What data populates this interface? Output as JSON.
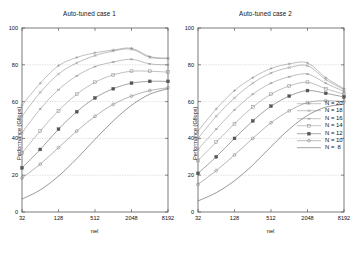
{
  "figure": {
    "width": 359,
    "height": 256,
    "background": "#ffffff"
  },
  "legend": {
    "position": "right-middle",
    "entries": [
      {
        "label": "N = 20",
        "marker": "plus",
        "color": "#8a8a8a"
      },
      {
        "label": "N = 18",
        "marker": "cross",
        "color": "#8a8a8a"
      },
      {
        "label": "N = 16",
        "marker": "asterisk",
        "color": "#8a8a8a"
      },
      {
        "label": "N = 14",
        "marker": "open-square",
        "color": "#8a8a8a"
      },
      {
        "label": "N = 12",
        "marker": "filled-square",
        "color": "#555555"
      },
      {
        "label": "N = 10",
        "marker": "open-circle",
        "color": "#777777"
      },
      {
        "label": "N =  8",
        "marker": "line-only",
        "color": "#444444"
      }
    ]
  },
  "chart_data": [
    {
      "type": "line",
      "title": "Auto-tuned case 1",
      "xlabel": "nel",
      "ylabel": "Performance (Gflops)",
      "xscale": "log2",
      "xticks": [
        32,
        128,
        512,
        2048,
        8192
      ],
      "xticklabels": [
        "32",
        "128",
        "512",
        "2048",
        "8192"
      ],
      "xlim": [
        32,
        8192
      ],
      "yticks": [
        0,
        20,
        40,
        60,
        80,
        100
      ],
      "yticklabels": [
        "0",
        "20",
        "40",
        "60",
        "80",
        "100"
      ],
      "ylim": [
        0,
        100
      ],
      "grid": "y-dashed",
      "x": [
        32,
        64,
        128,
        256,
        512,
        1024,
        2048,
        4096,
        8192
      ],
      "series": [
        {
          "name": "N = 20",
          "marker": "plus",
          "color": "#8a8a8a",
          "values": [
            58.0,
            70.0,
            79.5,
            84.0,
            86.5,
            88.0,
            89.0,
            84.5,
            83.5
          ]
        },
        {
          "name": "N = 18",
          "marker": "cross",
          "color": "#8a8a8a",
          "values": [
            52.0,
            65.0,
            75.0,
            81.0,
            85.0,
            87.5,
            88.5,
            84.0,
            83.5
          ]
        },
        {
          "name": "N = 16",
          "marker": "asterisk",
          "color": "#8a8a8a",
          "values": [
            43.0,
            56.0,
            66.5,
            74.0,
            79.0,
            81.5,
            83.0,
            80.5,
            80.0
          ]
        },
        {
          "name": "N = 14",
          "marker": "open-square",
          "color": "#8a8a8a",
          "values": [
            32.0,
            44.0,
            55.0,
            64.0,
            70.5,
            74.5,
            76.5,
            76.5,
            76.0
          ]
        },
        {
          "name": "N = 12",
          "marker": "filled-square",
          "color": "#555555",
          "values": [
            24.0,
            34.0,
            45.0,
            54.5,
            62.0,
            67.0,
            70.0,
            71.0,
            71.0
          ]
        },
        {
          "name": "N = 10",
          "marker": "open-circle",
          "color": "#777777",
          "values": [
            18.5,
            26.0,
            35.0,
            44.0,
            52.0,
            58.5,
            63.0,
            66.0,
            67.5
          ]
        },
        {
          "name": "N =  8",
          "marker": "line-only",
          "color": "#444444",
          "values": [
            7.0,
            12.0,
            19.5,
            29.0,
            39.5,
            49.5,
            58.0,
            64.0,
            67.0
          ]
        }
      ]
    },
    {
      "type": "line",
      "title": "Auto-tuned case 2",
      "xlabel": "nel",
      "ylabel": "Performance (Gflops)",
      "xscale": "log2",
      "xticks": [
        32,
        128,
        512,
        2048,
        8192
      ],
      "xticklabels": [
        "32",
        "128",
        "512",
        "2048",
        "8192"
      ],
      "xlim": [
        32,
        8192
      ],
      "yticks": [
        0,
        20,
        40,
        60,
        80,
        100
      ],
      "yticklabels": [
        "0",
        "20",
        "40",
        "60",
        "80",
        "100"
      ],
      "ylim": [
        0,
        100
      ],
      "grid": "y-dashed",
      "x": [
        32,
        64,
        128,
        256,
        512,
        1024,
        2048,
        4096,
        8192
      ],
      "series": [
        {
          "name": "N = 20",
          "marker": "plus",
          "color": "#8a8a8a",
          "values": [
            44.0,
            56.0,
            66.0,
            73.0,
            78.0,
            80.5,
            81.0,
            73.0,
            67.0
          ]
        },
        {
          "name": "N = 18",
          "marker": "cross",
          "color": "#8a8a8a",
          "values": [
            40.0,
            52.0,
            62.0,
            70.0,
            75.5,
            78.5,
            79.5,
            72.0,
            66.5
          ]
        },
        {
          "name": "N = 16",
          "marker": "asterisk",
          "color": "#8a8a8a",
          "values": [
            34.0,
            45.0,
            55.5,
            64.0,
            70.0,
            73.5,
            75.0,
            70.0,
            65.5
          ]
        },
        {
          "name": "N = 14",
          "marker": "open-square",
          "color": "#8a8a8a",
          "values": [
            28.0,
            38.0,
            48.0,
            57.0,
            64.0,
            68.5,
            70.5,
            67.0,
            64.0
          ]
        },
        {
          "name": "N = 12",
          "marker": "filled-square",
          "color": "#555555",
          "values": [
            21.0,
            30.0,
            40.0,
            49.5,
            57.5,
            63.0,
            66.0,
            64.5,
            62.5
          ]
        },
        {
          "name": "N = 10",
          "marker": "open-circle",
          "color": "#777777",
          "values": [
            15.0,
            22.5,
            31.0,
            40.0,
            48.5,
            55.0,
            59.5,
            60.5,
            60.0
          ]
        },
        {
          "name": "N =  8",
          "marker": "line-only",
          "color": "#444444",
          "values": [
            6.0,
            10.5,
            17.0,
            25.5,
            35.5,
            45.0,
            52.5,
            57.0,
            58.5
          ]
        }
      ]
    }
  ]
}
